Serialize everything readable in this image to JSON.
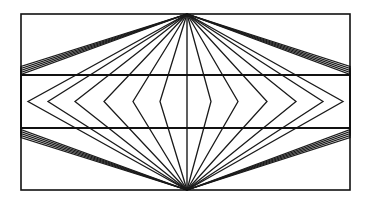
{
  "figure": {
    "name": "hering-illusion-figure",
    "canvas": {
      "width": 370,
      "height": 204
    },
    "background_color": "#ffffff",
    "ink_color": "#000000"
  },
  "geometry": {
    "frame": {
      "left": 21,
      "top": 14,
      "right": 350,
      "bottom": 190,
      "stroke_width": 1.6
    },
    "horizontal_lines": [
      {
        "name": "upper-horizontal-line",
        "y": 75,
        "stroke_width": 2.2
      },
      {
        "name": "lower-horizontal-line",
        "y": 128,
        "stroke_width": 2.2
      }
    ],
    "vertical_center_line": {
      "name": "center-vertical-line",
      "x": 187,
      "stroke_width": 1.4
    },
    "apexes": [
      {
        "name": "top-apex",
        "x": 187,
        "y": 14
      },
      {
        "name": "bottom-apex",
        "x": 187,
        "y": 190
      }
    ],
    "ray_stroke_width": 1.3,
    "ray_count_per_side": 11,
    "ray_left_border_hits_top": [
      66.5,
      68.5,
      70.5,
      72.5,
      74.5,
      77.5,
      82.0,
      89.0,
      97.5,
      107.0,
      117.0
    ],
    "ray_left_border_hits_bottom": [
      137.5,
      135.5,
      133.5,
      131.5,
      129.5,
      126.5,
      122.0,
      115.0,
      106.5,
      97.0,
      87.0
    ],
    "chevron_vertices_left_x": [
      21.0,
      21.0,
      21.0,
      21.0,
      21.0,
      28.0,
      48.0,
      75.0,
      104.0,
      133.0,
      160.0
    ],
    "chevron_vertices_right_x": [
      350.0,
      350.0,
      350.0,
      350.0,
      350.0,
      343.0,
      323.0,
      296.0,
      267.0,
      238.0,
      211.0
    ],
    "chevron_vertex_y": 101.5
  },
  "chart_data": {
    "type": "line",
    "xlabel": "",
    "ylabel": "",
    "grid": false,
    "legend": "none",
    "series": [
      {
        "name": "frame-rectangle",
        "values": []
      },
      {
        "name": "upper-horizontal-line",
        "values": []
      },
      {
        "name": "lower-horizontal-line",
        "values": []
      },
      {
        "name": "radiating-rays-top-apex",
        "values": []
      },
      {
        "name": "radiating-rays-bottom-apex",
        "values": []
      }
    ]
  }
}
